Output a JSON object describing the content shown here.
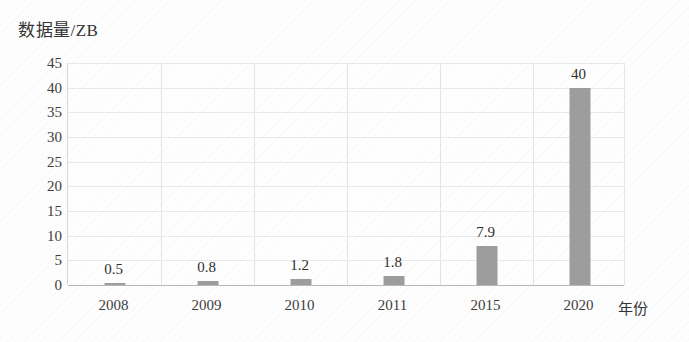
{
  "chart_data": {
    "type": "bar",
    "title": "",
    "ylabel": "数据量/ZB",
    "xlabel": "年份",
    "categories": [
      "2008",
      "2009",
      "2010",
      "2011",
      "2015",
      "2020"
    ],
    "values": [
      0.5,
      0.8,
      1.2,
      1.8,
      7.9,
      40
    ],
    "value_labels": [
      "0.5",
      "0.8",
      "1.2",
      "1.8",
      "7.9",
      "40"
    ],
    "ylim": [
      0,
      45
    ],
    "ytick_labels": [
      "45",
      "40",
      "35",
      "30",
      "25",
      "20",
      "15",
      "10",
      "5",
      "0"
    ],
    "ytick_values": [
      45,
      40,
      35,
      30,
      25,
      20,
      15,
      10,
      5,
      0
    ],
    "grid": true,
    "legend": "none",
    "series_color": "#9d9d9d"
  }
}
